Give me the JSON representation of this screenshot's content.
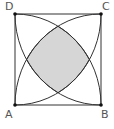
{
  "figure": {
    "type": "geometry",
    "vertices": {
      "A": {
        "label": "A",
        "x": 15,
        "y": 105
      },
      "B": {
        "label": "B",
        "x": 101,
        "y": 105
      },
      "C": {
        "label": "C",
        "x": 101,
        "y": 14
      },
      "D": {
        "label": "D",
        "x": 15,
        "y": 14
      }
    },
    "arcs": [
      {
        "center": "A",
        "from": "B",
        "to": "D"
      },
      {
        "center": "B",
        "from": "C",
        "to": "A"
      },
      {
        "center": "C",
        "from": "D",
        "to": "B"
      },
      {
        "center": "D",
        "from": "A",
        "to": "C"
      }
    ],
    "shaded_region": {
      "description": "intersection of the four quarter-circle disks",
      "fill": "#d6d6d6"
    },
    "colors": {
      "stroke": "#333333",
      "label": "#555555",
      "background": "#ffffff"
    }
  }
}
